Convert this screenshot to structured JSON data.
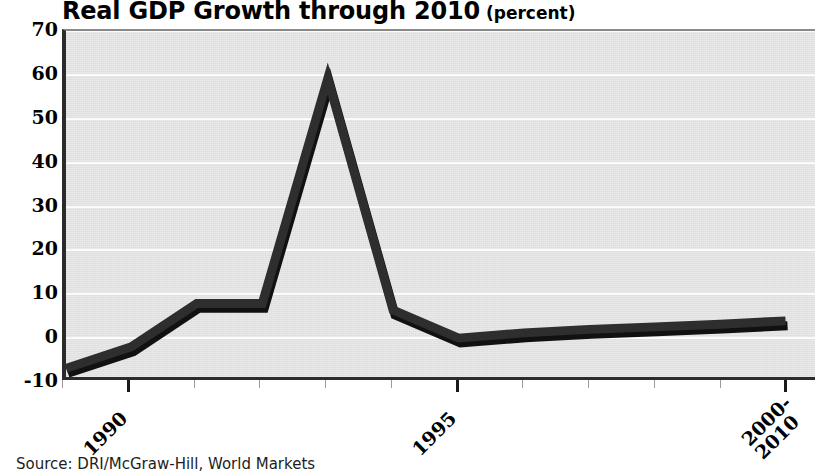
{
  "chart_data": {
    "type": "line",
    "title": "Real GDP Growth through 2010",
    "subtitle": "(percent)",
    "xlabel": "",
    "ylabel": "",
    "ylim": [
      -10,
      70
    ],
    "yticks": [
      70,
      60,
      50,
      40,
      30,
      20,
      10,
      0,
      -10
    ],
    "ytick_labels": [
      "70",
      "60",
      "50",
      "40",
      "30",
      "20",
      "10",
      "0",
      "-10"
    ],
    "grid": true,
    "legend": "none",
    "x": [
      "1989",
      "1990",
      "1991",
      "1992",
      "1993",
      "1994",
      "1995",
      "1996",
      "1997",
      "1998",
      "1999",
      "2000-2010"
    ],
    "xtick_labels": [
      "1990",
      "1995",
      "2000-2010"
    ],
    "xtick_label_lines": [
      [
        "1990"
      ],
      [
        "1995"
      ],
      [
        "2000-",
        "2010"
      ]
    ],
    "xtick_major_indices": [
      1,
      6,
      11
    ],
    "values": [
      -8,
      -3,
      7,
      7,
      59,
      5.5,
      -1,
      0.2,
      1,
      1.6,
      2.2,
      3
    ],
    "series": [
      {
        "name": "Real GDP Growth",
        "values": [
          -8,
          -3,
          7,
          7,
          59,
          5.5,
          -1,
          0.2,
          1,
          1.6,
          2.2,
          3
        ]
      }
    ],
    "line_color": "#2e2e2e",
    "plot_background": "#dedede",
    "gridline_color": "#fbfbfb",
    "source": "Source: DRI/McGraw-Hill, World Markets"
  },
  "axis": {
    "y_labels": [
      "70",
      "60",
      "50",
      "40",
      "30",
      "20",
      "10",
      "0",
      "-10"
    ],
    "x_labels": [
      "1990",
      "1995",
      "2000-2010"
    ]
  }
}
